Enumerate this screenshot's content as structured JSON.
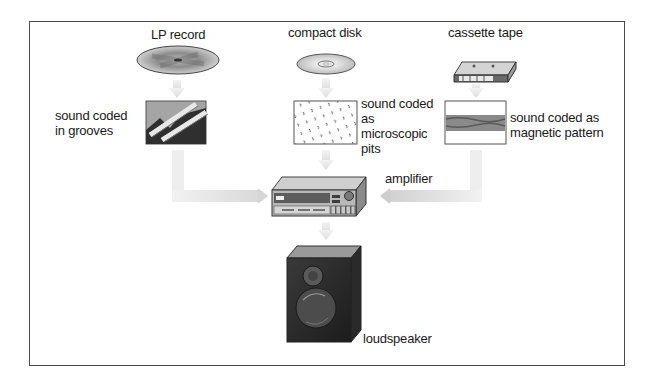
{
  "diagram": {
    "title": "",
    "sources": [
      {
        "id": "lp",
        "label": "LP record",
        "coding_label": "sound coded\nin grooves"
      },
      {
        "id": "cd",
        "label": "compact disk",
        "coding_label": "sound coded\nas\nmicroscopic\npits"
      },
      {
        "id": "cassette",
        "label": "cassette tape",
        "coding_label": "sound coded as\nmagnetic pattern"
      }
    ],
    "amplifier": {
      "label": "amplifier"
    },
    "speaker": {
      "label": "loudspeaker"
    },
    "flows": [
      {
        "from": "LP record",
        "to": "sound coded in grooves"
      },
      {
        "from": "compact disk",
        "to": "sound coded as microscopic pits"
      },
      {
        "from": "cassette tape",
        "to": "sound coded as magnetic pattern"
      },
      {
        "from": "sound coded in grooves",
        "to": "amplifier"
      },
      {
        "from": "sound coded as microscopic pits",
        "to": "amplifier"
      },
      {
        "from": "sound coded as magnetic pattern",
        "to": "amplifier"
      },
      {
        "from": "amplifier",
        "to": "loudspeaker"
      }
    ],
    "colors": {
      "arrow": "#e4e4e4",
      "border": "#4a4a4a",
      "text": "#1a1a1a"
    }
  }
}
